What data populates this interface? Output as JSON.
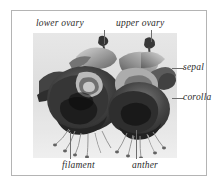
{
  "figure": {
    "frame_color": "#b4b4b4",
    "leader_color": "#6e6e6e",
    "text_color": "#2b2b2b",
    "photo_background": "#dcdcdc"
  },
  "labels": {
    "lower_ovary": "lower ovary",
    "upper_ovary": "upper ovary",
    "sepal": "sepal",
    "corolla": "corolla",
    "filament": "filament",
    "anther": "anther"
  }
}
